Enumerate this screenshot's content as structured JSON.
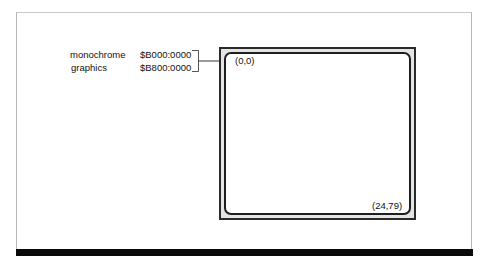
{
  "diagram": {
    "memory_map": [
      {
        "mode": "monochrome",
        "address": "$B000:0000"
      },
      {
        "mode": "graphics",
        "address": "$B800:0000"
      }
    ],
    "screen": {
      "top_left_coord": "(0,0)",
      "bottom_right_coord": "(24,79)"
    },
    "colors": {
      "frame_line": "#b8b8b8",
      "bottom_bar": "#0a0a0a",
      "screen_border": "#2a2a2a",
      "screen_bezel": "#e4e4e4"
    }
  }
}
